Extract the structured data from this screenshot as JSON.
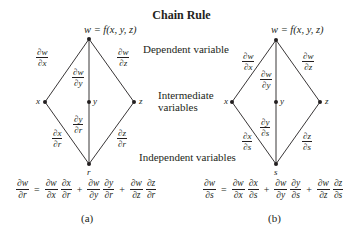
{
  "title": "Chain Rule",
  "labels": {
    "dependent": "Dependent variable",
    "intermediate_line1": "Intermediate",
    "intermediate_line2": "variables",
    "independent": "Independent variables"
  },
  "diagrams": [
    {
      "id": "a",
      "top": "w = f(x,  y,  z)",
      "nodes": {
        "x": "x",
        "y": "y",
        "z": "z",
        "bottom": "r"
      },
      "upper_edges": [
        {
          "num": "∂w",
          "den": "∂x"
        },
        {
          "num": "∂w",
          "den": "∂y"
        },
        {
          "num": "∂w",
          "den": "∂z"
        }
      ],
      "lower_edges": [
        {
          "num": "∂x",
          "den": "∂r"
        },
        {
          "num": "∂y",
          "den": "∂r"
        },
        {
          "num": "∂z",
          "den": "∂r"
        }
      ],
      "equation": {
        "lhs": {
          "num": "∂w",
          "den": "∂r"
        },
        "eq": "=",
        "terms": [
          [
            {
              "num": "∂w",
              "den": "∂x"
            },
            {
              "num": "∂x",
              "den": "∂r"
            }
          ],
          [
            {
              "num": "∂w",
              "den": "∂y"
            },
            {
              "num": "∂y",
              "den": "∂r"
            }
          ],
          [
            {
              "num": "∂w",
              "den": "∂z"
            },
            {
              "num": "∂z",
              "den": "∂r"
            }
          ]
        ],
        "plus": "+"
      },
      "caption": "(a)"
    },
    {
      "id": "b",
      "top": "w = f(x,  y,  z)",
      "nodes": {
        "x": "x",
        "y": "y",
        "z": "z",
        "bottom": "s"
      },
      "upper_edges": [
        {
          "num": "∂w",
          "den": "∂x"
        },
        {
          "num": "∂w",
          "den": "∂y"
        },
        {
          "num": "∂w",
          "den": "∂z"
        }
      ],
      "lower_edges": [
        {
          "num": "∂x",
          "den": "∂s"
        },
        {
          "num": "∂y",
          "den": "∂s"
        },
        {
          "num": "∂z",
          "den": "∂s"
        }
      ],
      "equation": {
        "lhs": {
          "num": "∂w",
          "den": "∂s"
        },
        "eq": "=",
        "terms": [
          [
            {
              "num": "∂w",
              "den": "∂x"
            },
            {
              "num": "∂x",
              "den": "∂s"
            }
          ],
          [
            {
              "num": "∂w",
              "den": "∂y"
            },
            {
              "num": "∂y",
              "den": "∂s"
            }
          ],
          [
            {
              "num": "∂w",
              "den": "∂z"
            },
            {
              "num": "∂z",
              "den": "∂s"
            }
          ]
        ],
        "plus": "+"
      },
      "caption": "(b)"
    }
  ],
  "colors": {
    "ink": "#231f20",
    "background": "#ffffff"
  }
}
